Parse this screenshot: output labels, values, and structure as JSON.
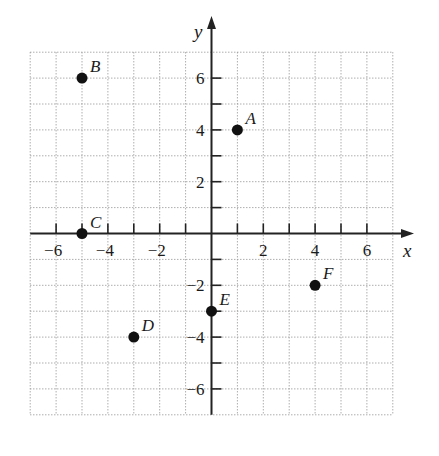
{
  "chart_data": {
    "type": "scatter",
    "title": "",
    "xlabel": "x",
    "ylabel": "y",
    "xlim": [
      -7,
      7
    ],
    "ylim": [
      -7,
      7
    ],
    "grid": true,
    "grid_style": "dotted",
    "x_tick_labels": [
      "-6",
      "-4",
      "-2",
      "2",
      "4",
      "6"
    ],
    "x_tick_values": [
      -6,
      -4,
      -2,
      2,
      4,
      6
    ],
    "y_tick_labels": [
      "6",
      "4",
      "2",
      "-2",
      "-4",
      "-6"
    ],
    "y_tick_values": [
      6,
      4,
      2,
      -2,
      -4,
      -6
    ],
    "points": [
      {
        "label": "A",
        "x": 1,
        "y": 4
      },
      {
        "label": "B",
        "x": -5,
        "y": 6
      },
      {
        "label": "C",
        "x": -5,
        "y": 0
      },
      {
        "label": "D",
        "x": -3,
        "y": -4
      },
      {
        "label": "E",
        "x": 0,
        "y": -3
      },
      {
        "label": "F",
        "x": 4,
        "y": -2
      }
    ],
    "colors": {
      "point": "#111111",
      "axis": "#222222",
      "grid": "#9a9a9a"
    }
  }
}
